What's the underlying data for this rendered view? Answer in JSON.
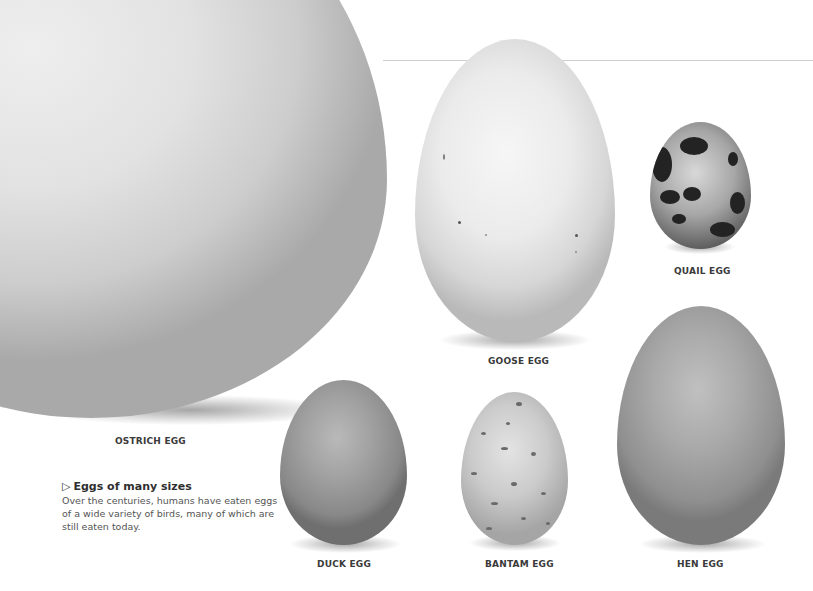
{
  "figure": {
    "eggs": [
      {
        "id": "ostrich",
        "label": "OSTRICH EGG"
      },
      {
        "id": "goose",
        "label": "GOOSE EGG"
      },
      {
        "id": "quail",
        "label": "QUAIL EGG"
      },
      {
        "id": "duck",
        "label": "DUCK EGG"
      },
      {
        "id": "bantam",
        "label": "BANTAM EGG"
      },
      {
        "id": "hen",
        "label": "HEN EGG"
      }
    ],
    "caption": {
      "marker": "▷",
      "title": "Eggs of many sizes",
      "body": "Over the centuries, humans have eaten eggs of a wide variety of birds, many of which are still eaten today."
    }
  }
}
